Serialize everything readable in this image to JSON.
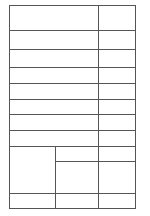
{
  "table": {
    "description": "blank grid form",
    "border_color": "#555555",
    "background": "#ffffff",
    "rows": [
      {
        "left": "",
        "right": ""
      },
      {
        "left": "",
        "right": ""
      },
      {
        "left": "",
        "right": ""
      },
      {
        "left": "",
        "right": ""
      },
      {
        "left": "",
        "right": ""
      },
      {
        "left": "",
        "right": ""
      },
      {
        "left": "",
        "right": ""
      },
      {
        "left": "",
        "right": ""
      },
      {
        "left_merged": "",
        "middle_top": "",
        "middle_bottom": "",
        "right_top": "",
        "right_bottom": ""
      },
      {
        "left": "",
        "middle": "",
        "right": ""
      }
    ]
  }
}
